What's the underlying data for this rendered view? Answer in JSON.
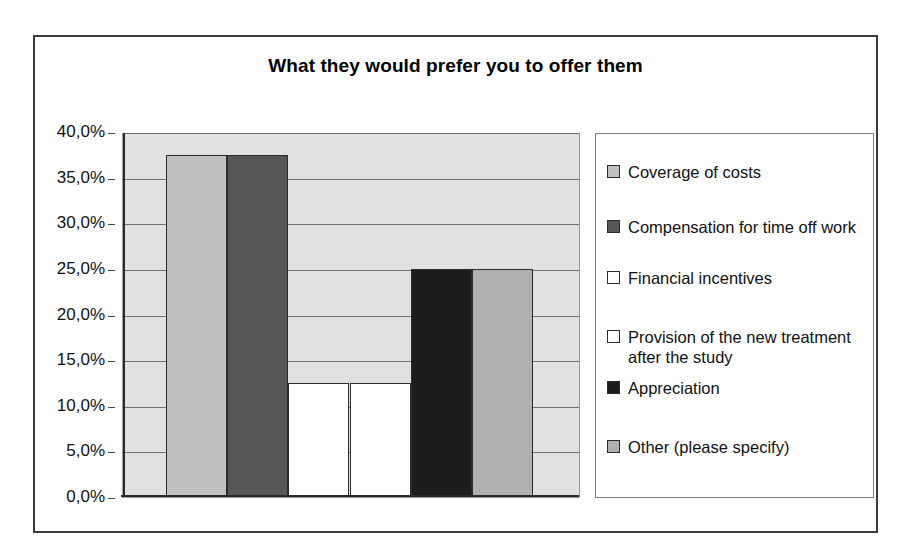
{
  "chart_data": {
    "type": "bar",
    "title": "What they would prefer you to offer them",
    "xlabel": "",
    "ylabel": "",
    "ylim": [
      0,
      40
    ],
    "grid": true,
    "legend_position": "right",
    "y_tick_labels": [
      "40,0%",
      "35,0%",
      "30,0%",
      "25,0%",
      "20,0%",
      "15,0%",
      "10,0%",
      "5,0%",
      "0,0%"
    ],
    "y_tick_values": [
      40,
      35,
      30,
      25,
      20,
      15,
      10,
      5,
      0
    ],
    "categories": [
      "Coverage of costs",
      "Compensation for time off work",
      "Financial incentives",
      "Provision of the new treatment after the study",
      "Appreciation",
      "Other (please specify)"
    ],
    "values": [
      37.5,
      37.5,
      12.5,
      12.5,
      25.0,
      25.0
    ],
    "colors": [
      "#c0c0c0",
      "#575757",
      "#ffffff",
      "#ffffff",
      "#1d1d1d",
      "#b0b0b0"
    ],
    "plot_background": "#e1e1e1",
    "bar_border_color": "#2b2b2b",
    "legend": [
      {
        "label": "Coverage of costs",
        "color": "#c0c0c0"
      },
      {
        "label": "Compensation for time off work",
        "color": "#575757"
      },
      {
        "label": "Financial incentives",
        "color": "#ffffff"
      },
      {
        "label": "Provision of the new treatment after the study",
        "color": "#ffffff"
      },
      {
        "label": "Appreciation",
        "color": "#1d1d1d"
      },
      {
        "label": "Other (please specify)",
        "color": "#b0b0b0"
      }
    ]
  }
}
